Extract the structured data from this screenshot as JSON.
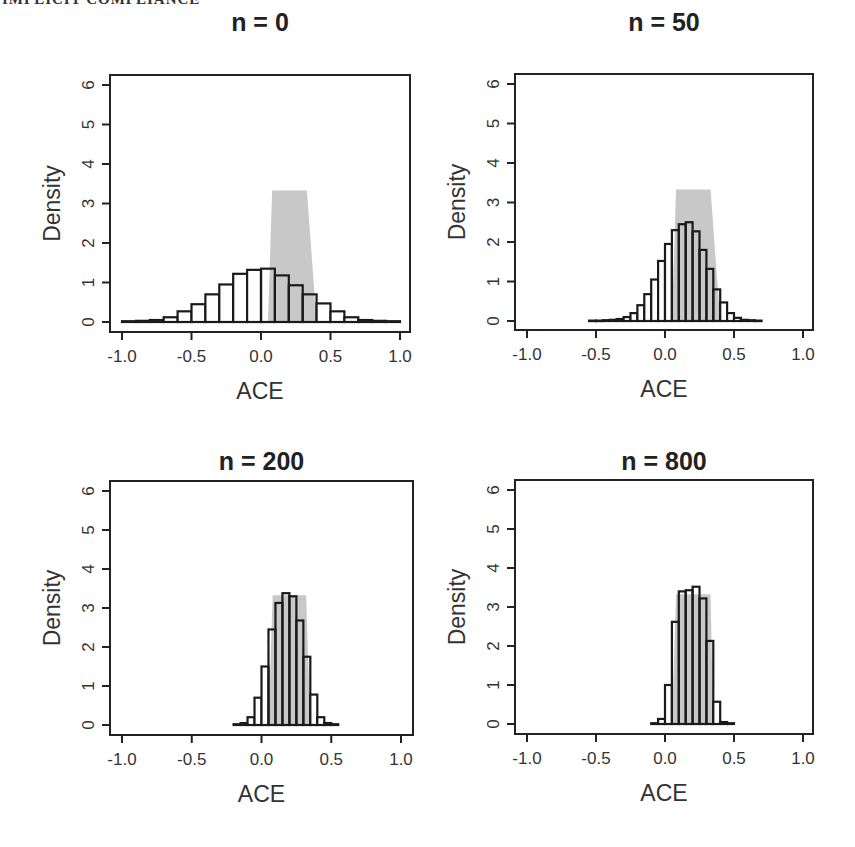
{
  "page": {
    "running_head": "IMPLICIT COMPLIANCE"
  },
  "colors": {
    "bar_stroke": "#1a1a1a",
    "bar_fill": "#ffffff",
    "shade": "#c8c8c8",
    "axis": "#222222"
  },
  "chart_data": [
    {
      "type": "bar",
      "title": "n = 0",
      "xlabel": "ACE",
      "ylabel": "Density",
      "xlim": [
        -1.0,
        1.0
      ],
      "ylim": [
        0,
        6
      ],
      "xticks": [
        "-1.0",
        "-0.5",
        "0.0",
        "0.5",
        "1.0"
      ],
      "yticks": [
        "0",
        "1",
        "2",
        "3",
        "4",
        "5",
        "6"
      ],
      "bin_width": 0.1,
      "bin_starts": [
        -1.0,
        -0.9,
        -0.8,
        -0.7,
        -0.6,
        -0.5,
        -0.4,
        -0.3,
        -0.2,
        -0.1,
        0.0,
        0.1,
        0.2,
        0.3,
        0.4,
        0.5,
        0.6,
        0.7,
        0.8,
        0.9
      ],
      "values": [
        0.02,
        0.03,
        0.05,
        0.12,
        0.27,
        0.45,
        0.7,
        0.95,
        1.22,
        1.32,
        1.35,
        1.18,
        0.93,
        0.7,
        0.47,
        0.27,
        0.12,
        0.05,
        0.03,
        0.02
      ],
      "shaded_region": {
        "x_bottom": [
          0.05,
          0.4
        ],
        "x_top": [
          0.08,
          0.33
        ],
        "height": 3.33
      }
    },
    {
      "type": "bar",
      "title": "n = 50",
      "xlabel": "ACE",
      "ylabel": "Density",
      "xlim": [
        -1.0,
        1.0
      ],
      "ylim": [
        0,
        6
      ],
      "xticks": [
        "-1.0",
        "-0.5",
        "0.0",
        "0.5",
        "1.0"
      ],
      "yticks": [
        "0",
        "1",
        "2",
        "3",
        "4",
        "5",
        "6"
      ],
      "bin_width": 0.05,
      "bin_starts": [
        -0.55,
        -0.5,
        -0.45,
        -0.4,
        -0.35,
        -0.3,
        -0.25,
        -0.2,
        -0.15,
        -0.1,
        -0.05,
        0.0,
        0.05,
        0.1,
        0.15,
        0.2,
        0.25,
        0.3,
        0.35,
        0.4,
        0.45,
        0.5,
        0.55,
        0.6,
        0.65
      ],
      "values": [
        0.01,
        0.01,
        0.02,
        0.03,
        0.05,
        0.1,
        0.2,
        0.4,
        0.68,
        1.05,
        1.52,
        1.95,
        2.3,
        2.45,
        2.5,
        2.27,
        1.8,
        1.32,
        0.8,
        0.47,
        0.2,
        0.08,
        0.03,
        0.02,
        0.01
      ],
      "shaded_region": {
        "x_bottom": [
          0.05,
          0.4
        ],
        "x_top": [
          0.08,
          0.33
        ],
        "height": 3.33
      }
    },
    {
      "type": "bar",
      "title": "n = 200",
      "xlabel": "ACE",
      "ylabel": "Density",
      "xlim": [
        -1.0,
        1.0
      ],
      "ylim": [
        0,
        6
      ],
      "xticks": [
        "-1.0",
        "-0.5",
        "0.0",
        "0.5",
        "1.0"
      ],
      "yticks": [
        "0",
        "1",
        "2",
        "3",
        "4",
        "5",
        "6"
      ],
      "bin_width": 0.05,
      "bin_starts": [
        -0.2,
        -0.15,
        -0.1,
        -0.05,
        0.0,
        0.05,
        0.1,
        0.15,
        0.2,
        0.25,
        0.3,
        0.35,
        0.4,
        0.45,
        0.5
      ],
      "values": [
        0.02,
        0.05,
        0.2,
        0.7,
        1.5,
        2.45,
        3.13,
        3.38,
        3.3,
        2.68,
        1.75,
        0.78,
        0.2,
        0.05,
        0.02
      ],
      "shaded_region": {
        "x_bottom": [
          0.05,
          0.35
        ],
        "x_top": [
          0.08,
          0.32
        ],
        "height": 3.33
      }
    },
    {
      "type": "bar",
      "title": "n = 800",
      "xlabel": "ACE",
      "ylabel": "Density",
      "xlim": [
        -1.0,
        1.0
      ],
      "ylim": [
        0,
        6
      ],
      "xticks": [
        "-1.0",
        "-0.5",
        "0.0",
        "0.5",
        "1.0"
      ],
      "yticks": [
        "0",
        "1",
        "2",
        "3",
        "4",
        "5",
        "6"
      ],
      "bin_width": 0.05,
      "bin_starts": [
        -0.1,
        -0.05,
        0.0,
        0.05,
        0.1,
        0.15,
        0.2,
        0.25,
        0.3,
        0.35,
        0.4,
        0.45
      ],
      "values": [
        0.02,
        0.13,
        1.0,
        2.62,
        3.4,
        3.43,
        3.52,
        3.22,
        2.13,
        0.57,
        0.05,
        0.02
      ],
      "shaded_region": {
        "x_bottom": [
          0.05,
          0.35
        ],
        "x_top": [
          0.08,
          0.33
        ],
        "height": 3.33
      }
    }
  ],
  "layout": {
    "panels": [
      {
        "title_x": 182,
        "title_y": 8,
        "box": [
          110,
          75,
          410,
          332
        ],
        "x_px": [
          122,
          400
        ],
        "y_px": [
          322,
          85
        ]
      },
      {
        "title_x": 588,
        "title_y": 8,
        "box": [
          515,
          74,
          813,
          330
        ],
        "x_px": [
          527,
          803
        ],
        "y_px": [
          321,
          84
        ]
      },
      {
        "title_x": 178,
        "title_y": 447,
        "box": [
          110,
          481,
          413,
          735
        ],
        "x_px": [
          122,
          401
        ],
        "y_px": [
          725,
          491
        ]
      },
      {
        "title_x": 584,
        "title_y": 447,
        "box": [
          515,
          480,
          813,
          734
        ],
        "x_px": [
          527,
          803
        ],
        "y_px": [
          724,
          490
        ]
      }
    ]
  }
}
